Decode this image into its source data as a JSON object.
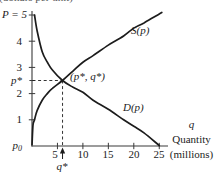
{
  "figure": {
    "top_axis_label_clipped": "(dollars per unit)",
    "p_axis": {
      "top_label": "P = 5",
      "tick_labels": [
        "4",
        "3",
        "2",
        "1"
      ],
      "pstar_label": "p*",
      "p0_base": "p",
      "p0_sub": "0"
    },
    "q_axis": {
      "tick_labels": [
        "5",
        "10",
        "15",
        "20",
        "25"
      ],
      "qstar_label": "q*",
      "title_symbol": "q",
      "title_word": "Quantity",
      "title_units": "(millions)"
    },
    "annotations": {
      "supply_label": "S(p)",
      "demand_label": "D(p)",
      "equilibrium_label": "(p*, q*)"
    },
    "colors": {
      "ink": "#1c1c1c",
      "axis": "#3a3a3a",
      "background": "#ffffff"
    }
  },
  "chart_data": {
    "type": "line",
    "xlabel": "q, Quantity (millions)",
    "ylabel": "P (dollars per unit)",
    "xlim": [
      0,
      27
    ],
    "ylim": [
      0,
      5.3
    ],
    "x_ticks": [
      5,
      10,
      15,
      20,
      25
    ],
    "y_ticks": [
      1,
      2,
      3,
      4,
      5
    ],
    "grid": false,
    "legend_position": "on-curve",
    "series": [
      {
        "name": "S(p)",
        "role": "supply",
        "x": [
          0,
          0.2,
          0.5,
          1,
          2,
          3,
          4,
          6,
          8,
          10,
          12,
          15,
          18,
          20,
          22,
          25.5
        ],
        "y": [
          0.05,
          0.8,
          1.0,
          1.35,
          1.75,
          2.0,
          2.2,
          2.5,
          2.85,
          3.2,
          3.45,
          3.85,
          4.2,
          4.5,
          4.7,
          5.1
        ]
      },
      {
        "name": "D(p)",
        "role": "demand",
        "x": [
          0.5,
          1,
          2,
          3,
          4,
          6,
          8,
          10,
          12,
          15,
          18,
          20,
          22,
          25
        ],
        "y": [
          5.0,
          4.4,
          3.6,
          3.2,
          2.9,
          2.5,
          2.25,
          2.05,
          1.75,
          1.4,
          1.0,
          0.75,
          0.5,
          0.02
        ]
      }
    ],
    "equilibrium": {
      "q": 6,
      "p": 2.5,
      "label": "(p*, q*)"
    },
    "axis_annotations": {
      "demand_price_intercept": "P = 5",
      "supply_price_intercept": "p0",
      "equilibrium_price": "p*",
      "equilibrium_quantity": "q*"
    }
  }
}
